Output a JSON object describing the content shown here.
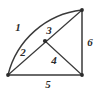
{
  "figure": {
    "background_color": "#ffffff",
    "stroke_color": "#3a3a3a",
    "label_color": "#2b2b2b",
    "width": 98,
    "height": 92,
    "vertices": {
      "bottom_left": {
        "x": 8,
        "y": 75
      },
      "bottom_right": {
        "x": 82,
        "y": 75
      },
      "top_right": {
        "x": 82,
        "y": 10
      },
      "center_dot": {
        "x": 45,
        "y": 41
      }
    },
    "arc": {
      "from": "bottom_left",
      "to": "top_right",
      "radius": 86,
      "sweep": "quarter-circle"
    },
    "labels": [
      {
        "id": "label-1",
        "text": "1",
        "x": 18,
        "y": 27,
        "describes": "arc"
      },
      {
        "id": "label-2",
        "text": "2",
        "x": 23,
        "y": 52,
        "describes": "lower-diagonal"
      },
      {
        "id": "label-3",
        "text": "3",
        "x": 49,
        "y": 30,
        "describes": "upper-diagonal"
      },
      {
        "id": "label-4",
        "text": "4",
        "x": 54,
        "y": 60,
        "describes": "dot-to-bottom-right"
      },
      {
        "id": "label-5",
        "text": "5",
        "x": 48,
        "y": 84,
        "describes": "bottom-edge"
      },
      {
        "id": "label-6",
        "text": "6",
        "x": 90,
        "y": 42,
        "describes": "right-edge"
      }
    ]
  }
}
